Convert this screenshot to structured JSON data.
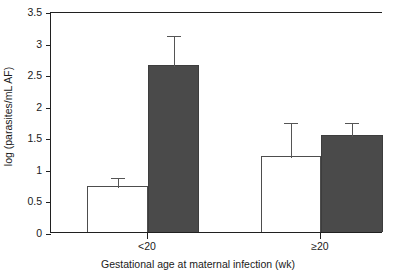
{
  "chart_data": {
    "type": "bar",
    "title": "",
    "xlabel": "Gestational age at maternal infection (wk)",
    "ylabel": "log (parasites/mL AF)",
    "categories": [
      "<20",
      "≥20"
    ],
    "ylim": [
      0,
      3.5
    ],
    "yticks": [
      "0",
      "0.5",
      "1",
      "1.5",
      "2",
      "2.5",
      "3",
      "3.5"
    ],
    "ytick_values": [
      0,
      0.5,
      1,
      1.5,
      2,
      2.5,
      3,
      3.5
    ],
    "grid": false,
    "legend": "none",
    "series": [
      {
        "name": "open-bar",
        "fill": "#ffffff",
        "values": [
          0.73,
          1.2
        ],
        "errors_upper": [
          0.88,
          1.76
        ]
      },
      {
        "name": "filled-bar",
        "fill": "#4a4a4a",
        "values": [
          2.64,
          1.54
        ],
        "errors_upper": [
          3.13,
          1.76
        ]
      }
    ]
  },
  "colors": {
    "filled_bar": "#4a4a4a",
    "open_bar": "#ffffff",
    "axis": "#202020",
    "error_bar": "#555555"
  }
}
